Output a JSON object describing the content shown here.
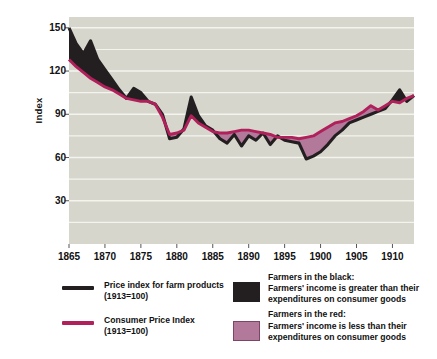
{
  "chart_data": {
    "type": "line",
    "title": "",
    "xlabel": "",
    "ylabel": "Index",
    "xlim": [
      1865,
      1913
    ],
    "ylim": [
      0,
      150
    ],
    "yticks": [
      150,
      120,
      90,
      60,
      30
    ],
    "xticks": [
      1865,
      1870,
      1875,
      1880,
      1885,
      1890,
      1895,
      1900,
      1905,
      1910
    ],
    "grid": "horizontal",
    "legend_position": "below",
    "plot_bg": "#d6d6cd",
    "x": [
      1865,
      1866,
      1867,
      1868,
      1869,
      1870,
      1871,
      1872,
      1873,
      1874,
      1875,
      1876,
      1877,
      1878,
      1879,
      1880,
      1881,
      1882,
      1883,
      1884,
      1885,
      1886,
      1887,
      1888,
      1889,
      1890,
      1891,
      1892,
      1893,
      1894,
      1895,
      1896,
      1897,
      1898,
      1899,
      1900,
      1901,
      1902,
      1903,
      1904,
      1905,
      1906,
      1907,
      1908,
      1909,
      1910,
      1911,
      1912,
      1913
    ],
    "series": [
      {
        "name": "Price index for farm products (1913=100)",
        "color": "#231f20",
        "values": [
          150,
          139,
          132,
          141,
          128,
          121,
          114,
          107,
          101,
          108,
          105,
          99,
          97,
          90,
          73,
          74,
          80,
          102,
          89,
          82,
          79,
          73,
          70,
          76,
          68,
          75,
          72,
          77,
          69,
          75,
          72,
          72,
          70,
          69,
          69,
          69,
          71,
          74,
          72,
          73,
          74,
          72,
          73,
          69,
          69,
          60,
          60,
          60,
          60
        ]
      },
      {
        "name": "Consumer Price Index (1913=100)",
        "color": "#b0205a",
        "values": [
          128,
          123,
          119,
          115,
          112,
          109,
          107,
          104,
          101,
          100,
          99,
          99,
          97,
          88,
          76,
          77,
          79,
          89,
          84,
          81,
          78,
          77,
          77,
          78,
          79,
          79,
          78,
          77,
          76,
          74,
          74,
          74,
          73,
          74,
          75,
          78,
          81,
          84,
          85,
          87,
          89,
          92,
          96,
          93,
          96,
          99,
          98,
          101,
          103
        ]
      }
    ],
    "series_black_corrected": {
      "name": "Price index for farm products (1913=100)",
      "values": [
        150,
        139,
        132,
        141,
        128,
        121,
        114,
        107,
        101,
        108,
        105,
        99,
        97,
        90,
        73,
        74,
        80,
        102,
        89,
        82,
        79,
        73,
        70,
        76,
        68,
        75,
        72,
        77,
        69,
        75,
        72,
        71,
        70,
        59,
        61,
        64,
        69,
        75,
        79,
        84,
        86,
        88,
        90,
        92,
        94,
        100,
        107,
        99,
        103
      ]
    },
    "fill_black": {
      "label": "Farmers in the black",
      "color": "#231f20",
      "description": "Farmers' income is greater than their expenditures on consumer goods"
    },
    "fill_red": {
      "label": "Farmers in the red",
      "color": "#b2799b",
      "description": "Farmers' income is less than their expenditures on consumer goods"
    }
  },
  "axes": {
    "ylabel": "Index",
    "yticks": [
      "150",
      "120",
      "90",
      "60",
      "30"
    ],
    "xticks": [
      "1865",
      "1870",
      "1875",
      "1880",
      "1885",
      "1890",
      "1895",
      "1900",
      "1905",
      "1910"
    ]
  },
  "legend": {
    "entries": [
      {
        "key": "farm-products",
        "marker": "line",
        "color": "#231f20",
        "line1": "Price index for farm products",
        "line2": "(1913=100)"
      },
      {
        "key": "consumer-price-index",
        "marker": "line",
        "color": "#b0205a",
        "line1": "Consumer Price Index",
        "line2": "(1913=100)"
      },
      {
        "key": "in-the-black",
        "marker": "swatch",
        "color": "#231f20",
        "line1": "Farmers in the black:",
        "line2": "Farmers' income is greater than their",
        "line3": "expenditures on consumer goods"
      },
      {
        "key": "in-the-red",
        "marker": "swatch",
        "color": "#b2799b",
        "line1": "Farmers in the red:",
        "line2": "Farmers' income is less than their",
        "line3": "expenditures on consumer goods"
      }
    ]
  }
}
